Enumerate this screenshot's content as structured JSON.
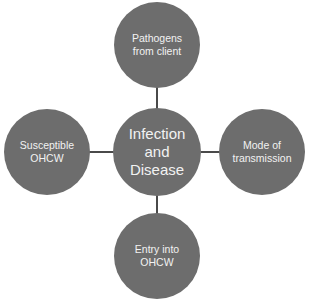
{
  "diagram": {
    "type": "hub-and-spoke",
    "colors": {
      "node_fill": "#6d6d6d",
      "node_text": "#f2f2f2",
      "connector": "#4a4a4a",
      "background": "#ffffff"
    },
    "center": {
      "label": "Infection and Disease",
      "lines": [
        "Infection",
        "and",
        "Disease"
      ]
    },
    "nodes": {
      "top": {
        "lines": [
          "Pathogens",
          "from client"
        ]
      },
      "right": {
        "lines": [
          "Mode of",
          "transmission"
        ]
      },
      "bottom": {
        "lines": [
          "Entry into",
          "OHCW"
        ]
      },
      "left": {
        "lines": [
          "Susceptible",
          "OHCW"
        ]
      }
    }
  }
}
